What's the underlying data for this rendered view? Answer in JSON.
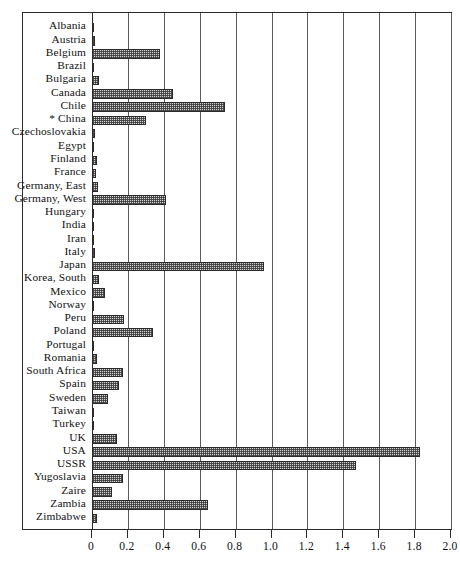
{
  "chart_data": {
    "type": "bar",
    "orientation": "horizontal",
    "title": "",
    "subtitle": "",
    "xlabel": "",
    "ylabel": "",
    "xlim": [
      0.0,
      2.0
    ],
    "xticks": [
      "0",
      "0.2",
      "0.4",
      "0.6",
      "0.8",
      "1.0",
      "1.2",
      "1.4",
      "1.6",
      "1.8",
      "2.0"
    ],
    "xtick_values": [
      0,
      0.2,
      0.4,
      0.6,
      0.8,
      1.0,
      1.2,
      1.4,
      1.6,
      1.8,
      2.0
    ],
    "grid": "vertical",
    "legend": "none",
    "categories": [
      "Albania",
      "Austria",
      "Belgium",
      "Brazil",
      "Bulgaria",
      "Canada",
      "Chile",
      "* China",
      "Czechoslovakia",
      "Egypt",
      "Finland",
      "France",
      "Germany, East",
      "Germany, West",
      "Hungary",
      "India",
      "Iran",
      "Italy",
      "Japan",
      "Korea, South",
      "Mexico",
      "Norway",
      "Peru",
      "Poland",
      "Portugal",
      "Romania",
      "South Africa",
      "Spain",
      "Sweden",
      "Taiwan",
      "Turkey",
      "UK",
      "USA",
      "USSR",
      "Yugoslavia",
      "Zaire",
      "Zambia",
      "Zimbabwe"
    ],
    "values": [
      0.005,
      0.015,
      0.38,
      0.012,
      0.04,
      0.45,
      0.74,
      0.3,
      0.018,
      0.002,
      0.03,
      0.025,
      0.035,
      0.41,
      0.008,
      0.004,
      0.002,
      0.015,
      0.96,
      0.04,
      0.07,
      0.01,
      0.18,
      0.34,
      0.002,
      0.03,
      0.17,
      0.15,
      0.09,
      0.005,
      0.012,
      0.14,
      1.83,
      1.47,
      0.17,
      0.11,
      0.645,
      0.03
    ],
    "colors": {
      "bar_fill": "#d2d2d2",
      "bar_edge": "#2b2b2b",
      "gridline": "#5a5a5a",
      "frame": "#2b2b2b",
      "text": "#111111",
      "background": "#ffffff"
    },
    "footnote_marker": "*"
  }
}
